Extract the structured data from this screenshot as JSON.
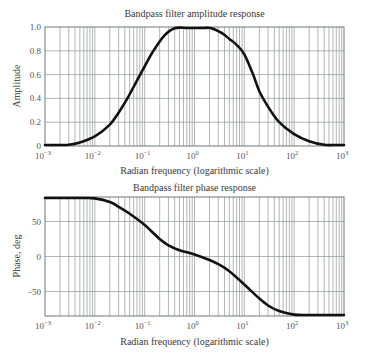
{
  "chart_data": [
    {
      "type": "line",
      "title": "Bandpass filter amplitude response",
      "xlabel": "Radian frequency (logarithmic scale)",
      "ylabel": "Amplitude",
      "xscale": "log",
      "xlim": [
        0.001,
        1000
      ],
      "ylim": [
        0,
        1.0
      ],
      "xticks": [
        0.001,
        0.01,
        0.1,
        1,
        10,
        100,
        1000
      ],
      "xtick_labels": [
        [
          "10",
          "-3"
        ],
        [
          "10",
          "-2"
        ],
        [
          "10",
          "-1"
        ],
        [
          "10",
          "0"
        ],
        [
          "10",
          "1"
        ],
        [
          "10",
          "2"
        ],
        [
          "10",
          "3"
        ]
      ],
      "yticks": [
        0,
        0.2,
        0.4,
        0.6,
        0.8,
        1.0
      ],
      "ytick_labels": [
        "0",
        "0.2",
        "0.4",
        "0.6",
        "0.8",
        "1.0"
      ],
      "grid": true,
      "x": [
        0.001,
        0.002,
        0.003,
        0.005,
        0.01,
        0.02,
        0.03,
        0.045,
        0.07,
        0.1,
        0.15,
        0.25,
        0.4,
        0.7,
        1,
        1.5,
        2.2,
        3.5,
        5,
        7,
        10,
        15,
        20,
        30,
        50,
        100,
        200,
        400,
        700,
        1000
      ],
      "values": [
        0.0,
        0.0,
        0.01,
        0.03,
        0.08,
        0.18,
        0.28,
        0.4,
        0.55,
        0.67,
        0.8,
        0.93,
        0.99,
        1.0,
        1.0,
        1.0,
        0.99,
        0.95,
        0.9,
        0.85,
        0.77,
        0.6,
        0.46,
        0.33,
        0.2,
        0.1,
        0.04,
        0.01,
        0.0,
        0.0
      ],
      "series": [
        {
          "name": "amplitude",
          "color": "#111111"
        }
      ]
    },
    {
      "type": "line",
      "title": "Bandpass filter phase response",
      "xlabel": "Radian frequency (logarithmic scale)",
      "ylabel": "Phase, deg",
      "xscale": "log",
      "xlim": [
        0.001,
        1000
      ],
      "ylim": [
        -85,
        85
      ],
      "xticks": [
        0.001,
        0.01,
        0.1,
        1,
        10,
        100,
        1000
      ],
      "xtick_labels": [
        [
          "10",
          "-3"
        ],
        [
          "10",
          "-2"
        ],
        [
          "10",
          "-1"
        ],
        [
          "10",
          "0"
        ],
        [
          "10",
          "1"
        ],
        [
          "10",
          "2"
        ],
        [
          "10",
          "3"
        ]
      ],
      "yticks": [
        -50,
        0,
        50
      ],
      "ytick_labels": [
        "−50",
        "0",
        "50"
      ],
      "grid": true,
      "x": [
        0.001,
        0.003,
        0.006,
        0.01,
        0.02,
        0.03,
        0.05,
        0.1,
        0.2,
        0.3,
        0.5,
        1,
        2,
        3,
        5,
        10,
        20,
        30,
        50,
        100,
        200,
        500,
        1000
      ],
      "values": [
        85,
        85,
        84,
        83,
        78,
        71,
        61,
        45,
        25,
        16,
        9,
        3,
        -5,
        -11,
        -21,
        -40,
        -60,
        -70,
        -78,
        -83,
        -84,
        -85,
        -85
      ],
      "series": [
        {
          "name": "phase",
          "color": "#111111"
        }
      ]
    }
  ]
}
